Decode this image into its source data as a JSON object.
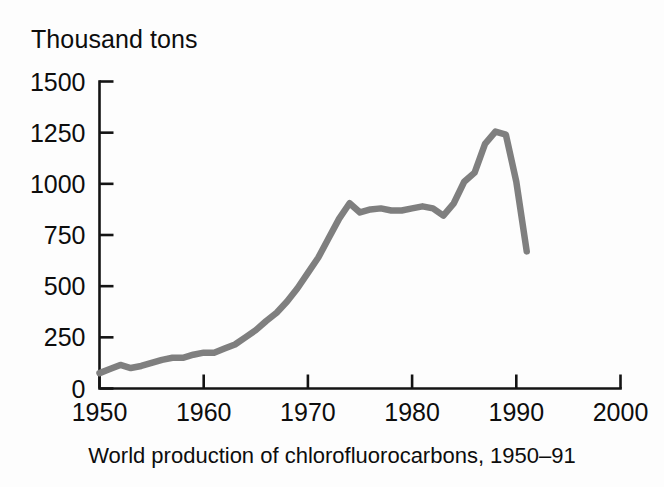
{
  "figure": {
    "axis_title": "Thousand tons",
    "caption": "World production of chlorofluorocarbons, 1950–91",
    "line_color": "#7f7f7f",
    "axis_color": "#141414",
    "background_color": "#fdfdfd"
  },
  "chart_data": {
    "type": "line",
    "title": "",
    "subtitle": "",
    "xlabel": "",
    "ylabel": "Thousand tons",
    "caption": "World production of chlorofluorocarbons, 1950–91",
    "xlim": [
      1950,
      2000
    ],
    "ylim": [
      0,
      1500
    ],
    "xticks": [
      1950,
      1960,
      1970,
      1980,
      1990,
      2000
    ],
    "yticks": [
      0,
      250,
      500,
      750,
      1000,
      1250,
      1500
    ],
    "xticklabels": [
      "1950",
      "1960",
      "1970",
      "1980",
      "1990",
      "2000"
    ],
    "yticklabels": [
      "0",
      "250",
      "500",
      "750",
      "1000",
      "1250",
      "1500"
    ],
    "grid": false,
    "legend": false,
    "legend_position": "none",
    "series": [
      {
        "name": "World CFC production",
        "color": "#7f7f7f",
        "x": [
          1950,
          1951,
          1952,
          1953,
          1954,
          1955,
          1956,
          1957,
          1958,
          1959,
          1960,
          1961,
          1962,
          1963,
          1964,
          1965,
          1966,
          1967,
          1968,
          1969,
          1970,
          1971,
          1972,
          1973,
          1974,
          1975,
          1976,
          1977,
          1978,
          1979,
          1980,
          1981,
          1982,
          1983,
          1984,
          1985,
          1986,
          1987,
          1988,
          1989,
          1990,
          1991
        ],
        "values": [
          75,
          95,
          115,
          100,
          110,
          125,
          140,
          150,
          150,
          165,
          175,
          175,
          195,
          215,
          250,
          285,
          330,
          370,
          425,
          490,
          565,
          640,
          735,
          830,
          905,
          860,
          875,
          880,
          870,
          870,
          880,
          890,
          880,
          845,
          905,
          1010,
          1055,
          1195,
          1255,
          1240,
          1010,
          670
        ]
      }
    ],
    "annotations": []
  }
}
